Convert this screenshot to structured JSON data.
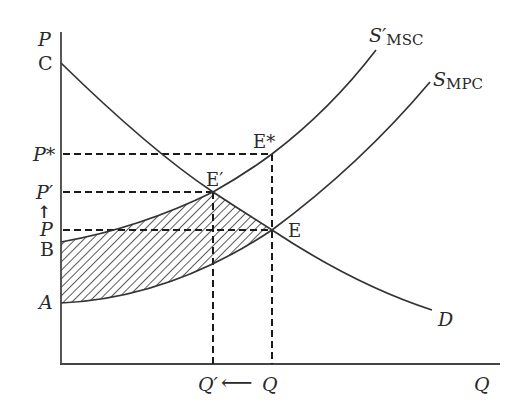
{
  "diagram": {
    "type": "supply-demand externality diagram",
    "axes": {
      "y_label": "P",
      "x_label": "Q"
    },
    "curves": {
      "demand": {
        "label": "D"
      },
      "msc": {
        "label_main": "S′",
        "label_sub": "MSC"
      },
      "mpc": {
        "label_main": "S",
        "label_sub": "MPC"
      }
    },
    "y_labels": {
      "c": "C",
      "p_star": "P*",
      "p_prime": "P′",
      "up_arrow": "↑",
      "p": "P",
      "b": "B",
      "a": "A"
    },
    "x_labels": {
      "q_prime": "Q′",
      "left_arrow": "⟵",
      "q": "Q"
    },
    "points": {
      "e_star": "E*",
      "e_prime": "E′",
      "e": "E"
    },
    "colors": {
      "line": "#333333",
      "hatch": "#333333",
      "background": "#ffffff"
    }
  }
}
